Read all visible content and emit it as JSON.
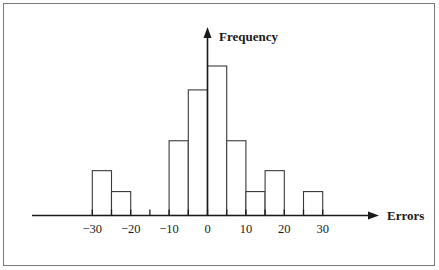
{
  "figure": {
    "name": "histogram-of-errors",
    "background_color": "#ffffff",
    "frame_color": "#7a7a7a",
    "ink_color": "#1a1a1a",
    "bar_stroke_color": "#3a3a3a",
    "bar_fill_color": "#ffffff"
  },
  "chart_data": {
    "type": "bar",
    "title": "",
    "subtitle": "",
    "xlabel": "Errors",
    "ylabel": "Frequency",
    "grid": false,
    "legend": null,
    "bin_width": 5,
    "xlim": [
      -32.5,
      34
    ],
    "ylim": [
      0,
      10.6
    ],
    "xticks": [
      -30,
      -20,
      -10,
      0,
      10,
      20,
      30
    ],
    "xtick_labels": [
      "−30",
      "−20",
      "−10",
      "0",
      "10",
      "20",
      "30"
    ],
    "minor_xticks": [
      -25,
      -15,
      -5,
      5,
      15,
      25
    ],
    "yticks": [],
    "ytick_labels": [],
    "bins": [
      {
        "left": -30,
        "right": -25,
        "value": 3.0
      },
      {
        "left": -25,
        "right": -20,
        "value": 1.6
      },
      {
        "left": -20,
        "right": -15,
        "value": 0
      },
      {
        "left": -15,
        "right": -10,
        "value": 0
      },
      {
        "left": -10,
        "right": -5,
        "value": 5.0
      },
      {
        "left": -5,
        "right": 0,
        "value": 8.4
      },
      {
        "left": 0,
        "right": 5,
        "value": 10.0
      },
      {
        "left": 5,
        "right": 10,
        "value": 5.0
      },
      {
        "left": 10,
        "right": 15,
        "value": 1.6
      },
      {
        "left": 15,
        "right": 20,
        "value": 3.0
      },
      {
        "left": 20,
        "right": 25,
        "value": 0
      },
      {
        "left": 25,
        "right": 30,
        "value": 1.6
      }
    ],
    "categories": [
      "[-30,-25)",
      "[-25,-20)",
      "[-20,-15)",
      "[-15,-10)",
      "[-10,-5)",
      "[-5,0)",
      "[0,5)",
      "[5,10)",
      "[10,15)",
      "[15,20)",
      "[20,25)",
      "[25,30)"
    ],
    "values": [
      3.0,
      1.6,
      0,
      0,
      5.0,
      8.4,
      10.0,
      5.0,
      1.6,
      3.0,
      0,
      1.6
    ]
  }
}
